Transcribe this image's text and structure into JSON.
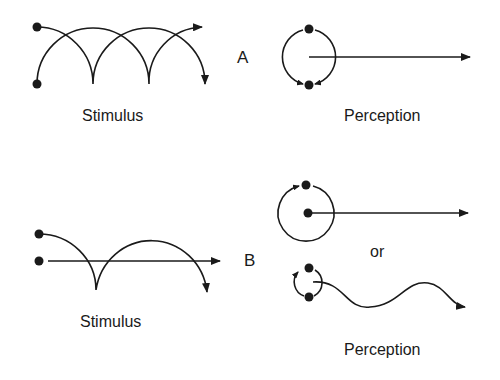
{
  "panel_a": {
    "label": "A",
    "stimulus_label": "Stimulus",
    "perception_label": "Perception"
  },
  "panel_b": {
    "label": "B",
    "stimulus_label": "Stimulus",
    "alternative_label": "or",
    "perception_label": "Perception"
  },
  "colors": {
    "ink": "#1a1a1a",
    "background": "#ffffff"
  }
}
